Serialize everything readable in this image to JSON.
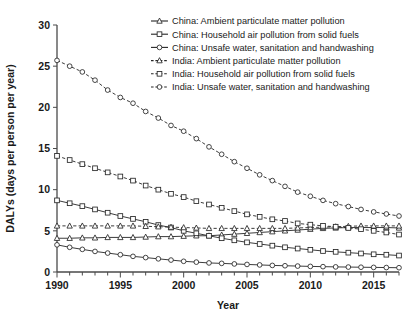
{
  "chart_data": {
    "type": "line",
    "title": "",
    "xlabel": "Year",
    "ylabel": "DALYs (days per person per year)",
    "xlim": [
      1990,
      2017
    ],
    "ylim": [
      0,
      30
    ],
    "xticks": [
      1990,
      1995,
      2000,
      2005,
      2010,
      2015
    ],
    "yticks": [
      0,
      5,
      10,
      15,
      20,
      25,
      30
    ],
    "grid": false,
    "legend_position": "top-right",
    "x": [
      1990,
      1991,
      1992,
      1993,
      1994,
      1995,
      1996,
      1997,
      1998,
      1999,
      2000,
      2001,
      2002,
      2003,
      2004,
      2005,
      2006,
      2007,
      2008,
      2009,
      2010,
      2011,
      2012,
      2013,
      2014,
      2015,
      2016,
      2017
    ],
    "series": [
      {
        "name": "China: Ambient particulate matter pollution",
        "marker": "triangle",
        "linestyle": "solid",
        "values": [
          4.1,
          4.1,
          4.15,
          4.15,
          4.2,
          4.2,
          4.2,
          4.25,
          4.3,
          4.3,
          4.35,
          4.4,
          4.4,
          4.5,
          4.6,
          4.7,
          4.8,
          4.9,
          5.0,
          5.1,
          5.2,
          5.3,
          5.35,
          5.4,
          5.4,
          5.4,
          5.4,
          5.35
        ]
      },
      {
        "name": "China: Household air pollution from solid fuels",
        "marker": "square",
        "linestyle": "solid",
        "values": [
          8.7,
          8.35,
          8.0,
          7.6,
          7.2,
          6.8,
          6.45,
          6.1,
          5.7,
          5.4,
          5.0,
          4.7,
          4.4,
          4.1,
          3.85,
          3.6,
          3.4,
          3.2,
          3.0,
          2.85,
          2.7,
          2.55,
          2.45,
          2.35,
          2.25,
          2.15,
          2.1,
          2.0
        ]
      },
      {
        "name": "China: Unsafe water, sanitation and handwashing",
        "marker": "circle",
        "linestyle": "solid",
        "values": [
          3.3,
          3.0,
          2.75,
          2.5,
          2.3,
          2.1,
          1.9,
          1.75,
          1.6,
          1.45,
          1.3,
          1.2,
          1.1,
          1.05,
          0.98,
          0.92,
          0.86,
          0.8,
          0.76,
          0.72,
          0.68,
          0.65,
          0.62,
          0.6,
          0.58,
          0.56,
          0.54,
          0.52
        ]
      },
      {
        "name": "India: Ambient particulate matter pollution",
        "marker": "triangle",
        "linestyle": "dashed",
        "values": [
          5.6,
          5.6,
          5.6,
          5.6,
          5.6,
          5.6,
          5.6,
          5.55,
          5.5,
          5.45,
          5.4,
          5.35,
          5.3,
          5.3,
          5.3,
          5.3,
          5.3,
          5.3,
          5.3,
          5.35,
          5.4,
          5.45,
          5.5,
          5.55,
          5.6,
          5.6,
          5.6,
          5.6
        ]
      },
      {
        "name": "India: Household air pollution from solid fuels",
        "marker": "square",
        "linestyle": "dashed",
        "values": [
          14.1,
          13.6,
          13.1,
          12.6,
          12.1,
          11.6,
          11.1,
          10.5,
          10.0,
          9.5,
          9.1,
          8.6,
          8.2,
          7.8,
          7.4,
          7.0,
          6.7,
          6.4,
          6.2,
          5.9,
          5.75,
          5.6,
          5.5,
          5.35,
          5.2,
          5.0,
          4.8,
          4.55
        ]
      },
      {
        "name": "India: Unsafe water, sanitation and handwashing",
        "marker": "circle",
        "linestyle": "dashed",
        "values": [
          25.7,
          25.0,
          24.3,
          23.3,
          22.1,
          21.2,
          20.5,
          19.5,
          18.7,
          17.8,
          17.1,
          16.2,
          15.2,
          14.3,
          13.4,
          12.6,
          11.8,
          11.1,
          10.4,
          9.7,
          9.2,
          8.7,
          8.3,
          7.95,
          7.6,
          7.3,
          7.05,
          6.8
        ]
      }
    ]
  },
  "legend": {
    "items": [
      "China: Ambient particulate matter pollution",
      "China: Household air pollution from solid fuels",
      "China: Unsafe water, sanitation and handwashing",
      "India: Ambient particulate matter pollution",
      "India: Household air pollution from solid fuels",
      "India: Unsafe water, sanitation and handwashing"
    ]
  },
  "axes": {
    "x_title": "Year",
    "y_title": "DALYs (days per person per year)",
    "x_tick_labels": [
      "1990",
      "1995",
      "2000",
      "2005",
      "2010",
      "2015"
    ],
    "y_tick_labels": [
      "0",
      "5",
      "10",
      "15",
      "20",
      "25",
      "30"
    ]
  },
  "colors": {
    "line": "#262626",
    "axis": "#4a4a4a",
    "text": "#1a1a1a",
    "background": "#ffffff"
  }
}
